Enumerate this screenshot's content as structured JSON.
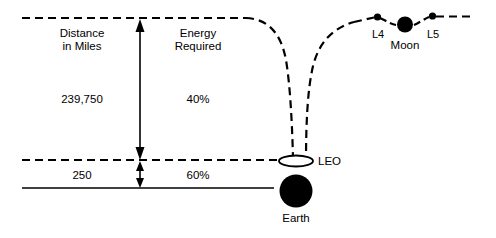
{
  "diagram": {
    "columns": {
      "distance_header": "Distance\nin Miles",
      "energy_header": "Energy\nRequired"
    },
    "tiers": [
      {
        "name": "earth-to-moon",
        "distance": "239,750",
        "energy": "40%"
      },
      {
        "name": "surface-to-leo",
        "distance": "250",
        "energy": "60%"
      }
    ],
    "bodies": [
      {
        "id": "leo",
        "label": "LEO"
      },
      {
        "id": "earth",
        "label": "Earth"
      },
      {
        "id": "moon",
        "label": "Moon"
      }
    ],
    "lagrange_points": [
      {
        "id": "l4",
        "label": "L4"
      },
      {
        "id": "l5",
        "label": "L5"
      }
    ],
    "colors": {
      "ink": "#000000",
      "background": "#ffffff"
    }
  }
}
